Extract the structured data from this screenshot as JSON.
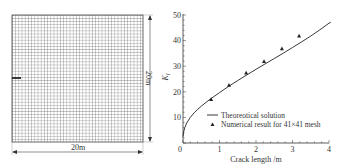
{
  "figure": {
    "mesh_panel": {
      "width_label": "20m",
      "height_label": "20m",
      "mesh_size": "41×41",
      "grid_divisions": 41,
      "crack": "edge crack on left side"
    }
  },
  "chart_data": {
    "type": "line",
    "title": "",
    "xlabel": "Crack length /m",
    "ylabel": "K",
    "ylabel_subscript": "I",
    "xlim": [
      0,
      4
    ],
    "ylim": [
      0,
      50
    ],
    "x_ticks": [
      "0",
      "1",
      "2",
      "3",
      "4"
    ],
    "y_ticks": [
      "10",
      "20",
      "30",
      "40",
      "50"
    ],
    "grid": false,
    "legend_position": "lower right",
    "legend": [
      "Theoreotical solution",
      "Numerical result for 41×41 mesh"
    ],
    "series": [
      {
        "name": "Theoreotical solution",
        "style": "line",
        "x": [
          0.0,
          0.02,
          0.05,
          0.1,
          0.2,
          0.3,
          0.4,
          0.5,
          0.75,
          1.0,
          1.25,
          1.5,
          1.75,
          2.0,
          2.25,
          2.5,
          2.75,
          3.0,
          3.25,
          3.5,
          3.75,
          4.0
        ],
        "values": [
          2.5,
          4.5,
          6.0,
          7.8,
          10.0,
          11.7,
          13.1,
          14.4,
          17.2,
          19.7,
          22.1,
          24.4,
          26.6,
          28.8,
          30.9,
          33.0,
          35.1,
          37.3,
          39.5,
          41.8,
          44.2,
          46.8
        ]
      },
      {
        "name": "Numerical result for 41×41 mesh",
        "style": "triangle-markers",
        "x": [
          0.77,
          1.26,
          1.73,
          2.22,
          2.71,
          3.18
        ],
        "values": [
          17.0,
          22.5,
          27.3,
          31.8,
          36.8,
          41.8
        ]
      }
    ]
  }
}
